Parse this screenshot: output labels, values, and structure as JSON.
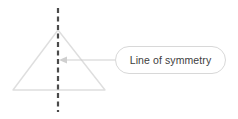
{
  "canvas": {
    "width": 238,
    "height": 119,
    "background": "#ffffff"
  },
  "diagram": {
    "shape": {
      "name": "triangle",
      "type": "isosceles-triangle",
      "stroke_color": "#dedede",
      "stroke_width": 1.4,
      "fill": "none",
      "points": "58,30 105,90 13,90",
      "apex": {
        "x": 58,
        "y": 30
      },
      "base_left": {
        "x": 13,
        "y": 90
      },
      "base_right": {
        "x": 105,
        "y": 90
      }
    },
    "symmetry_line": {
      "name": "line-of-symmetry",
      "orientation": "vertical",
      "x": 58,
      "y_start": 8,
      "y_end": 112,
      "stroke_color": "#4a4a4a",
      "stroke_width": 2.2,
      "dash_pattern": "5 3.5"
    },
    "leader": {
      "name": "leader-line",
      "stroke_color": "#cfcfcf",
      "stroke_width": 1,
      "x_start": 115,
      "x_end": 62,
      "y": 60,
      "arrow": {
        "name": "arrowhead",
        "direction": "left",
        "tip_x": 59,
        "tip_y": 60,
        "color": "#cfcfcf",
        "points": "59,60 67,56.5 67,63.5"
      }
    },
    "callout": {
      "name": "callout-label-box",
      "text": "Line of symmetry",
      "text_color": "#3d3d3d",
      "background": "#ffffff",
      "border_color": "#d8d8d8",
      "border_radius": 14,
      "x": 115,
      "y": 46,
      "width": 111,
      "height": 28
    }
  }
}
